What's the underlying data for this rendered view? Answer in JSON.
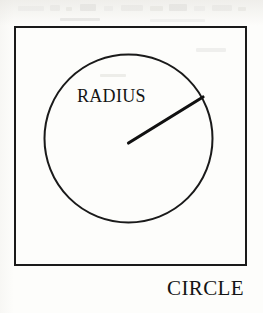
{
  "figure": {
    "caption": "CIRCLE",
    "radius_label": "RADIUS",
    "shape_name": "circle",
    "frame_shape": "square",
    "colors": {
      "ink": "#1a1a1a",
      "paper": "#fdfdfb"
    }
  },
  "geometry": {
    "frame": {
      "x": 14,
      "y": 26,
      "width": 233,
      "height": 240,
      "stroke_width": 2
    },
    "circle": {
      "center_x": 128.5,
      "center_y": 138.5,
      "radius": 84,
      "stroke_width": 2
    },
    "radius_segment": {
      "x1": 128.5,
      "y1": 143,
      "x2": 203,
      "y2": 97,
      "stroke_width": 3
    }
  },
  "artifacts": [
    {
      "x": 18,
      "y": 6,
      "width": 26,
      "height": 5
    },
    {
      "x": 50,
      "y": 5,
      "width": 10,
      "height": 6
    },
    {
      "x": 66,
      "y": 7,
      "width": 6,
      "height": 4
    },
    {
      "x": 80,
      "y": 4,
      "width": 16,
      "height": 7
    },
    {
      "x": 104,
      "y": 6,
      "width": 9,
      "height": 5
    },
    {
      "x": 121,
      "y": 5,
      "width": 22,
      "height": 6
    },
    {
      "x": 150,
      "y": 6,
      "width": 13,
      "height": 5
    },
    {
      "x": 169,
      "y": 4,
      "width": 18,
      "height": 7
    },
    {
      "x": 194,
      "y": 6,
      "width": 11,
      "height": 5
    },
    {
      "x": 212,
      "y": 5,
      "width": 20,
      "height": 6
    },
    {
      "x": 238,
      "y": 7,
      "width": 8,
      "height": 4
    },
    {
      "x": 60,
      "y": 18,
      "width": 40,
      "height": 3
    },
    {
      "x": 150,
      "y": 19,
      "width": 55,
      "height": 3
    },
    {
      "x": 196,
      "y": 48,
      "width": 30,
      "height": 4
    },
    {
      "x": 100,
      "y": 74,
      "width": 26,
      "height": 3
    }
  ]
}
